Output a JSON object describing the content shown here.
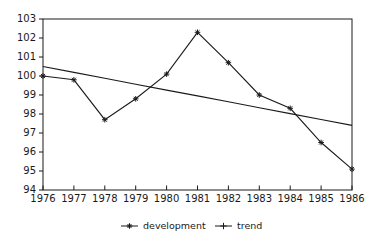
{
  "chart_data": {
    "type": "line",
    "title": "",
    "xlabel": "",
    "ylabel": "",
    "grid": false,
    "background": "#ffffff",
    "line_color": "#1a1a1a",
    "x": [
      1976,
      1977,
      1978,
      1979,
      1980,
      1981,
      1982,
      1983,
      1984,
      1985,
      1986
    ],
    "y_ticks": [
      94,
      95,
      96,
      97,
      98,
      99,
      100,
      101,
      102,
      103
    ],
    "ylim": [
      94,
      103
    ],
    "series": [
      {
        "name": "development",
        "marker": "star",
        "show_point_markers": true,
        "values": [
          100.0,
          99.8,
          97.7,
          98.8,
          100.1,
          102.3,
          100.7,
          99.0,
          98.3,
          96.5,
          95.1
        ]
      },
      {
        "name": "trend",
        "marker": "plus",
        "show_point_markers": false,
        "values": [
          100.5,
          100.19,
          99.88,
          99.57,
          99.26,
          98.95,
          98.64,
          98.33,
          98.02,
          97.71,
          97.4
        ]
      }
    ],
    "legend_position": "bottom"
  },
  "legend": {
    "items": [
      {
        "label": "development",
        "marker": "star"
      },
      {
        "label": "trend",
        "marker": "plus"
      }
    ]
  }
}
